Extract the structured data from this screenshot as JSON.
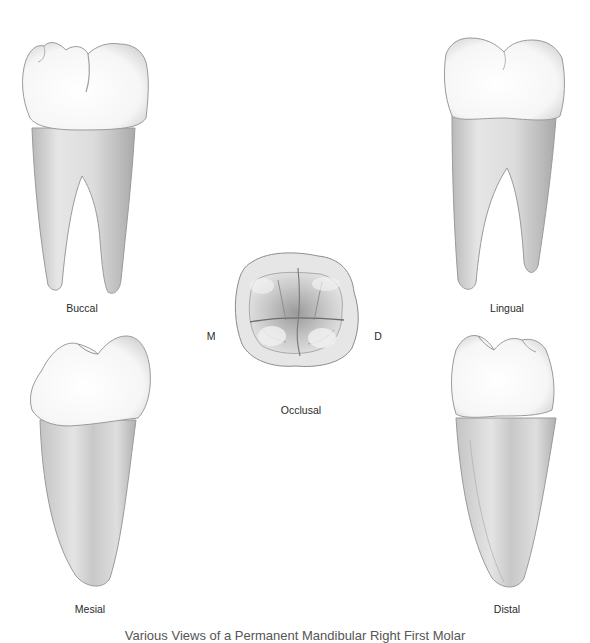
{
  "figure": {
    "caption": "Various Views of a Permanent Mandibular Right First Molar",
    "views": [
      {
        "id": "buccal",
        "label": "Buccal"
      },
      {
        "id": "lingual",
        "label": "Lingual"
      },
      {
        "id": "occlusal",
        "label": "Occlusal"
      },
      {
        "id": "mesial",
        "label": "Mesial"
      },
      {
        "id": "distal",
        "label": "Distal"
      }
    ],
    "orientation": {
      "left": "M",
      "right": "D"
    },
    "colors": {
      "enamel": "#f7f7f7",
      "root": "#d9d9d9",
      "outline": "#8a8a8a",
      "shadow": "#a8a8a8"
    }
  }
}
